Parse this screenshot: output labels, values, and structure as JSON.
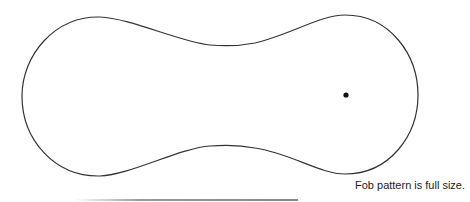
{
  "diagram": {
    "title": "Fob pattern",
    "caption": "Fob pattern is full size.",
    "shape": "dumbbell-outline",
    "stroke_color": "#333333",
    "hole_marker": {
      "cx": 346,
      "cy": 95
    }
  }
}
